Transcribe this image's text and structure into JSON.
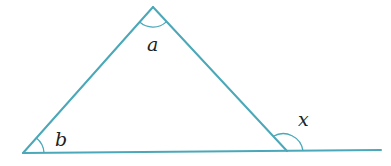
{
  "diagram": {
    "type": "geometry-triangle-exterior-angle",
    "line_color": "#4aa8b8",
    "label_color": "#222222",
    "vertices": {
      "apex": {
        "x": 153,
        "y": 7
      },
      "bottom_left": {
        "x": 23,
        "y": 153
      },
      "bottom_right": {
        "x": 287,
        "y": 151
      }
    },
    "base_extension_end": {
      "x": 381,
      "y": 150
    },
    "angles": [
      {
        "name": "a",
        "label": "a",
        "position": "interior angle at apex"
      },
      {
        "name": "b",
        "label": "b",
        "position": "interior angle at bottom-left vertex"
      },
      {
        "name": "x",
        "label": "x",
        "position": "exterior angle at bottom-right vertex"
      }
    ]
  }
}
